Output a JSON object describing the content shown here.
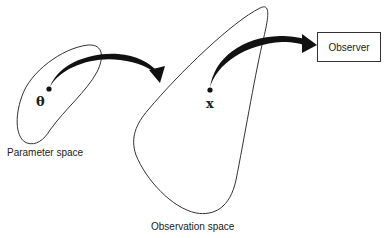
{
  "diagram": {
    "parameter_space": {
      "label": "Parameter space",
      "point_symbol": "θ"
    },
    "observation_space": {
      "label": "Observation space",
      "point_symbol": "x"
    },
    "observer": {
      "label": "Observer"
    },
    "arrows": [
      {
        "from": "θ",
        "to": "Observation space"
      },
      {
        "from": "x",
        "to": "Observer"
      }
    ],
    "colors": {
      "stroke": "#333333",
      "arrow": "#111111",
      "background": "#ffffff"
    }
  }
}
